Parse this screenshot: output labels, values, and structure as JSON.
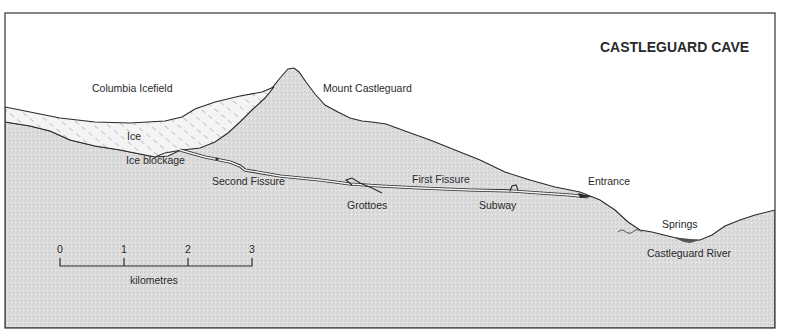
{
  "title": "CASTLEGUARD CAVE",
  "labels": {
    "icefield": "Columbia Icefield",
    "mountain": "Mount Castleguard",
    "ice": "Ice",
    "ice_blockage": "Ice blockage",
    "second_fissure": "Second Fissure",
    "grottoes": "Grottoes",
    "first_fissure": "First Fissure",
    "subway": "Subway",
    "entrance": "Entrance",
    "springs": "Springs",
    "river": "Castleguard River"
  },
  "scale_bar": {
    "ticks": [
      "0",
      "1",
      "2",
      "3"
    ],
    "unit": "kilometres"
  },
  "colors": {
    "rock": "#dcdcdc",
    "ice_hatch": "#8a8a8a",
    "line": "#2a2a2a",
    "water": "#555555",
    "frame": "#444444"
  }
}
